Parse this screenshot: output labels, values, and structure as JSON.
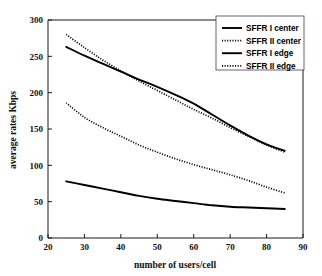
{
  "chart_data": {
    "type": "line",
    "title": "",
    "xlabel": "number of users/cell",
    "ylabel": "average rates   Kbps",
    "ylabel_parts": [
      "average rates",
      "Kbps"
    ],
    "xlim": [
      20,
      90
    ],
    "ylim": [
      0,
      300
    ],
    "xticks": [
      20,
      30,
      40,
      50,
      60,
      70,
      80,
      90
    ],
    "xtick_labels": [
      "20",
      "30",
      "40",
      "50",
      "60",
      "70",
      "80",
      "90"
    ],
    "yticks": [
      0,
      50,
      100,
      150,
      200,
      250,
      300
    ],
    "ytick_labels": [
      "0",
      "50",
      "100",
      "150",
      "200",
      "250",
      "300"
    ],
    "grid": false,
    "legend_position": "upper-right",
    "x": [
      25,
      30,
      35,
      40,
      45,
      50,
      55,
      60,
      65,
      70,
      75,
      80,
      85
    ],
    "series": [
      {
        "name": "SFFR I center",
        "style": "solid",
        "color": "#000000",
        "values": [
          263,
          251,
          240,
          229,
          218,
          208,
          197,
          185,
          170,
          155,
          141,
          129,
          120
        ]
      },
      {
        "name": "SFFR II center",
        "style": "dotted",
        "color": "#000000",
        "values": [
          280,
          262,
          245,
          230,
          216,
          203,
          190,
          177,
          165,
          152,
          140,
          128,
          118
        ]
      },
      {
        "name": "SFFR I edge",
        "style": "solid",
        "color": "#000000",
        "values": [
          78,
          73,
          68,
          63,
          58,
          54,
          51,
          48,
          45,
          43,
          42,
          41,
          40
        ]
      },
      {
        "name": "SFFR II edge",
        "style": "dotted",
        "color": "#000000",
        "values": [
          186,
          166,
          152,
          140,
          128,
          118,
          109,
          101,
          94,
          87,
          79,
          70,
          62
        ]
      }
    ]
  },
  "legend": {
    "entries": [
      {
        "label": "SFFR I center"
      },
      {
        "label": "SFFR II center"
      },
      {
        "label": "SFFR I edge"
      },
      {
        "label": "SFFR II edge"
      }
    ]
  }
}
